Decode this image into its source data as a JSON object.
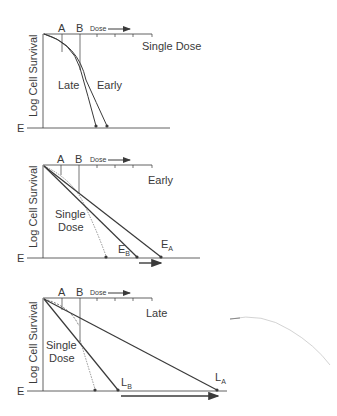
{
  "axes": {
    "y_label": "Log Cell Survival",
    "endpoint_label": "E",
    "dose_label": "Dose",
    "marker_a": "A",
    "marker_b": "B"
  },
  "panels": [
    {
      "title": "Single Dose",
      "curve_labels": [
        "Late",
        "Early"
      ]
    },
    {
      "title": "Early",
      "curve_label": "Single Dose",
      "curve_label_line1": "Single",
      "curve_label_line2": "Dose",
      "endpoints": [
        {
          "label": "E",
          "subscript": "B"
        },
        {
          "label": "E",
          "subscript": "A"
        }
      ]
    },
    {
      "title": "Late",
      "curve_label": "Single Dose",
      "curve_label_line1": "Single",
      "curve_label_line2": "Dose",
      "endpoints": [
        {
          "label": "L",
          "subscript": "B"
        },
        {
          "label": "L",
          "subscript": "A"
        }
      ]
    }
  ],
  "colors": {
    "line": "#3a3a3a",
    "dotted": "#777777",
    "stray_mark": "#c8c8c8"
  }
}
